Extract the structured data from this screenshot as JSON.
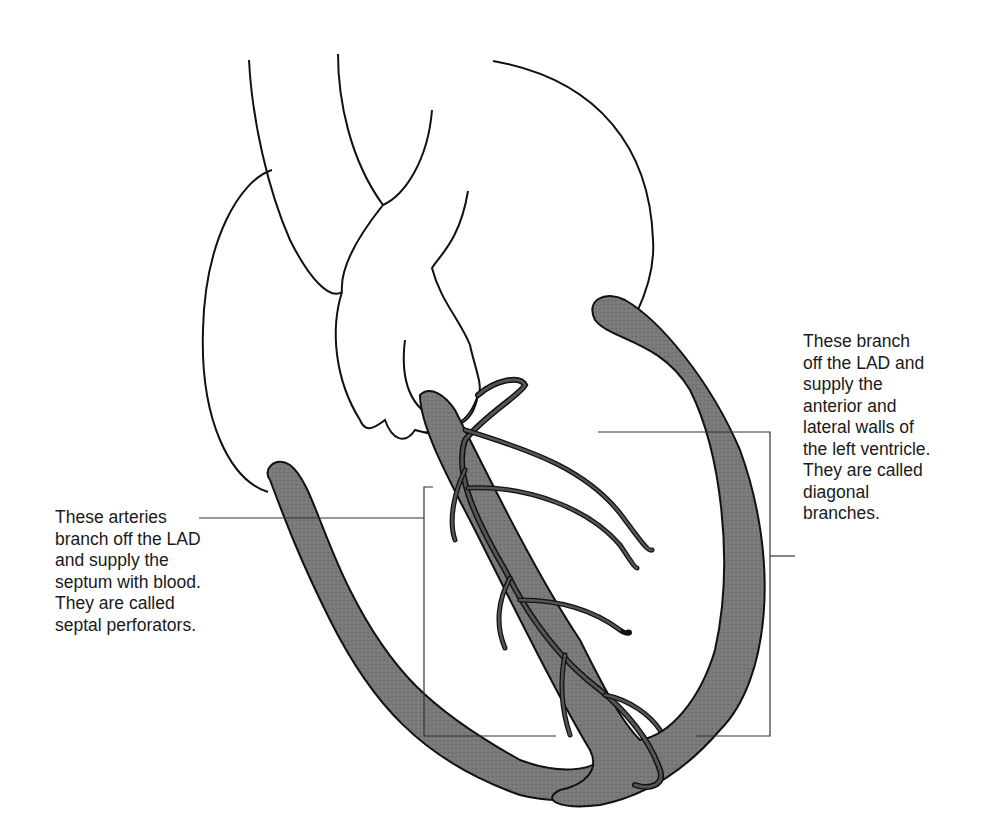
{
  "figure": {
    "colors": {
      "outline": "#111111",
      "myocardium_fill": "#7a7a7a",
      "artery_fill": "#555555",
      "background": "#ffffff",
      "leader_line": "#333333"
    }
  },
  "labels": {
    "septal": {
      "lines": [
        "These arteries",
        "branch off the LAD",
        "and supply the",
        "septum with blood.",
        "They are called",
        "septal perforators."
      ]
    },
    "diagonal": {
      "lines": [
        "These branch",
        "off the LAD and",
        "supply the",
        "anterior and",
        "lateral walls of",
        "the left ventricle.",
        "They are called",
        "diagonal",
        "branches."
      ]
    }
  },
  "structures": {
    "septum": "interventricular-septum",
    "lv_wall": "left-ventricular-wall",
    "rv_wall": "right-ventricular-wall",
    "lad": "left-anterior-descending-artery",
    "septal_branches": "septal-perforator-arteries",
    "diagonal_branches": "diagonal-branch-arteries",
    "great_vessels": "aorta-and-pulmonary-trunk",
    "atria": "right-and-left-atria"
  }
}
